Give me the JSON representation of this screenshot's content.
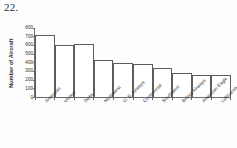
{
  "page": {
    "problem_number": "22."
  },
  "chart_data": {
    "type": "bar",
    "title": "",
    "xlabel": "",
    "ylabel": "Number of Aircraft",
    "ylim": [
      0,
      800
    ],
    "ytick_step": 100,
    "yticks": [
      "800",
      "700",
      "600",
      "500",
      "400",
      "300",
      "200",
      "100",
      "0"
    ],
    "grid": false,
    "legend": "none",
    "categories": [
      "American",
      "United",
      "Delta",
      "Northwest",
      "U. S. Airways",
      "Continental",
      "Southwest",
      "British Airways",
      "American Eagle",
      "Lufthansa (Ger.)"
    ],
    "values": [
      710,
      600,
      605,
      425,
      390,
      375,
      335,
      275,
      255,
      248
    ]
  }
}
